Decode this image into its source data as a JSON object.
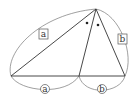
{
  "diagram": {
    "type": "angle-bisector-theorem",
    "labels": {
      "side_left": "a",
      "side_right": "b",
      "base_left": "a",
      "base_right": "b"
    },
    "angle_marks": "equal angles (dots)",
    "colors": {
      "stroke": "#333333",
      "arc": "#555555",
      "background": "#ffffff"
    }
  }
}
